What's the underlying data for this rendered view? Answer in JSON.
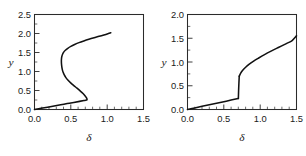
{
  "figure": {
    "background": "#ffffff",
    "curve_color": "#111111",
    "axis_color": "#2b2b2b"
  },
  "chart_data": [
    {
      "type": "line",
      "panel": "left",
      "title": "",
      "xlabel": "δ",
      "ylabel": "y",
      "xlim": [
        0.0,
        1.5
      ],
      "ylim": [
        0.0,
        2.5
      ],
      "xticks": [
        0.0,
        0.5,
        1.0,
        1.5
      ],
      "xticklabels": [
        "0.0",
        "0.5",
        "1.0",
        "1.5"
      ],
      "yticks": [
        0.0,
        0.5,
        1.0,
        1.5,
        2.0,
        2.5
      ],
      "yticklabels": [
        "0.0",
        "0.5",
        "1.0",
        "1.5",
        "2.0",
        "2.5"
      ],
      "grid": false,
      "legend": "none",
      "minor_ticks": true,
      "description": "S-shaped bistable response curve folding back on itself",
      "series": [
        {
          "name": "S-curve branch",
          "x": [
            0.0,
            0.09,
            0.18,
            0.27,
            0.36,
            0.45,
            0.54,
            0.62,
            0.68,
            0.715,
            0.723,
            0.718,
            0.7,
            0.668,
            0.628,
            0.585,
            0.54,
            0.498,
            0.462,
            0.432,
            0.41,
            0.394,
            0.383,
            0.376,
            0.372,
            0.37,
            0.371,
            0.376,
            0.386,
            0.402,
            0.425,
            0.458,
            0.5,
            0.552,
            0.612,
            0.678,
            0.748,
            0.82,
            0.89,
            0.955,
            1.01,
            1.05
          ],
          "y": [
            0.0,
            0.031,
            0.062,
            0.093,
            0.124,
            0.155,
            0.186,
            0.214,
            0.234,
            0.248,
            0.262,
            0.3,
            0.35,
            0.42,
            0.49,
            0.56,
            0.63,
            0.7,
            0.77,
            0.84,
            0.91,
            0.98,
            1.05,
            1.12,
            1.19,
            1.26,
            1.33,
            1.395,
            1.455,
            1.51,
            1.56,
            1.61,
            1.66,
            1.71,
            1.76,
            1.805,
            1.848,
            1.888,
            1.925,
            1.962,
            1.995,
            2.02
          ]
        }
      ]
    },
    {
      "type": "line",
      "panel": "right",
      "title": "",
      "xlabel": "δ",
      "ylabel": "y",
      "xlim": [
        0.0,
        1.5
      ],
      "ylim": [
        0.0,
        2.0
      ],
      "xticks": [
        0.0,
        0.5,
        1.0,
        1.5
      ],
      "xticklabels": [
        "0.0",
        "0.5",
        "1.0",
        "1.5"
      ],
      "yticks": [
        0.0,
        0.5,
        1.0,
        1.5,
        2.0
      ],
      "yticklabels": [
        "0.0",
        "0.5",
        "1.0",
        "1.5",
        "2.0"
      ],
      "grid": false,
      "legend": "none",
      "minor_ticks": true,
      "description": "Linear lower branch with an abrupt jump near delta = 0.70 followed by a concave increasing branch",
      "series": [
        {
          "name": "lower branch",
          "x": [
            0.0,
            0.1,
            0.2,
            0.3,
            0.4,
            0.5,
            0.6,
            0.68,
            0.7
          ],
          "y": [
            0.0,
            0.033,
            0.066,
            0.099,
            0.132,
            0.165,
            0.198,
            0.224,
            0.23
          ]
        },
        {
          "name": "jump",
          "x": [
            0.7,
            0.705,
            0.712
          ],
          "y": [
            0.23,
            0.47,
            0.7
          ]
        },
        {
          "name": "upper branch",
          "x": [
            0.712,
            0.73,
            0.76,
            0.8,
            0.85,
            0.91,
            0.98,
            1.06,
            1.15,
            1.25,
            1.36,
            1.44,
            1.5
          ],
          "y": [
            0.7,
            0.76,
            0.825,
            0.89,
            0.955,
            1.02,
            1.085,
            1.155,
            1.228,
            1.305,
            1.388,
            1.452,
            1.55
          ]
        }
      ]
    }
  ]
}
